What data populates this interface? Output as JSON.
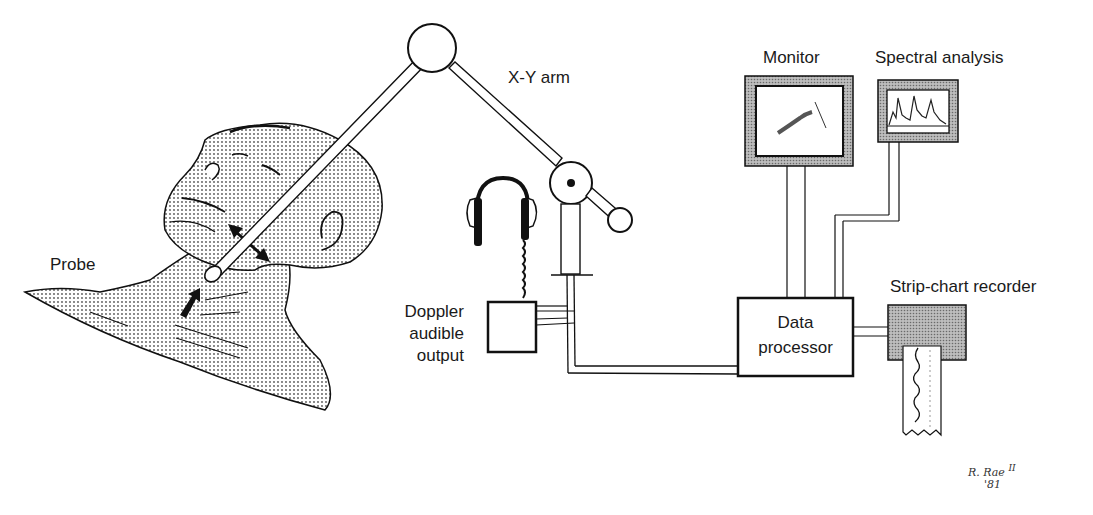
{
  "diagram": {
    "type": "medical-equipment-schematic",
    "labels": {
      "probe": "Probe",
      "xy_arm": "X-Y arm",
      "monitor": "Monitor",
      "spectral_analysis": "Spectral analysis",
      "doppler_line1": "Doppler",
      "doppler_line2": "audible",
      "doppler_line3": "output",
      "data_processor_line1": "Data",
      "data_processor_line2": "processor",
      "strip_chart_recorder": "Strip-chart recorder"
    },
    "signature": {
      "name": "R. Rae",
      "suffix": "II",
      "year": "'81"
    },
    "components": [
      {
        "id": "patient",
        "name": "Patient head and neck"
      },
      {
        "id": "probe",
        "name": "Probe"
      },
      {
        "id": "xy-arm",
        "name": "X-Y arm"
      },
      {
        "id": "headphones",
        "name": "Headphones"
      },
      {
        "id": "doppler-box",
        "name": "Doppler audible output"
      },
      {
        "id": "data-processor",
        "name": "Data processor"
      },
      {
        "id": "monitor",
        "name": "Monitor"
      },
      {
        "id": "spectral-display",
        "name": "Spectral analysis"
      },
      {
        "id": "strip-chart",
        "name": "Strip-chart recorder"
      }
    ],
    "connections": [
      {
        "from": "probe",
        "to": "xy-arm"
      },
      {
        "from": "xy-arm",
        "to": "doppler-box"
      },
      {
        "from": "xy-arm",
        "to": "data-processor"
      },
      {
        "from": "data-processor",
        "to": "monitor"
      },
      {
        "from": "data-processor",
        "to": "spectral-display"
      },
      {
        "from": "data-processor",
        "to": "strip-chart"
      },
      {
        "from": "doppler-box",
        "to": "headphones"
      }
    ],
    "colors": {
      "ink": "#111111",
      "stipple": "#9a9a9a",
      "paper": "#ffffff"
    }
  }
}
